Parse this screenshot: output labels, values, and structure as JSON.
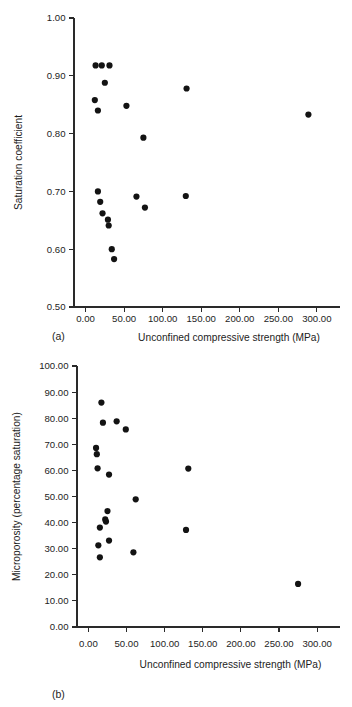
{
  "figure": {
    "panel_a_label": "(a)",
    "panel_b_label": "(b)"
  },
  "chart_data": [
    {
      "type": "scatter",
      "panel": "(a)",
      "title": "",
      "xlabel": "Unconfined compressive strength (MPa)",
      "ylabel": "Saturation coefficient",
      "xlim": [
        -15,
        330
      ],
      "ylim": [
        0.5,
        1.0
      ],
      "xticks": [
        0,
        50,
        100,
        150,
        200,
        250,
        300
      ],
      "xticklabels": [
        "0.00",
        "50.00",
        "100.00",
        "150.00",
        "200.00",
        "250.00",
        "300.00"
      ],
      "yticks": [
        0.5,
        0.6,
        0.7,
        0.8,
        0.9,
        1.0
      ],
      "yticklabels": [
        "0.50",
        "0.60",
        "0.70",
        "0.80",
        "0.90",
        "1.00"
      ],
      "grid": false,
      "legend": false,
      "marker": "circle",
      "marker_color": "#131313",
      "points": [
        {
          "x": 13,
          "y": 0.918
        },
        {
          "x": 21,
          "y": 0.918
        },
        {
          "x": 31,
          "y": 0.918
        },
        {
          "x": 25,
          "y": 0.888
        },
        {
          "x": 12,
          "y": 0.858
        },
        {
          "x": 16,
          "y": 0.84
        },
        {
          "x": 53,
          "y": 0.848
        },
        {
          "x": 131,
          "y": 0.878
        },
        {
          "x": 289,
          "y": 0.833
        },
        {
          "x": 75,
          "y": 0.793
        },
        {
          "x": 16,
          "y": 0.7
        },
        {
          "x": 19,
          "y": 0.682
        },
        {
          "x": 22,
          "y": 0.662
        },
        {
          "x": 29,
          "y": 0.651
        },
        {
          "x": 30,
          "y": 0.641
        },
        {
          "x": 34,
          "y": 0.6
        },
        {
          "x": 37,
          "y": 0.583
        },
        {
          "x": 66,
          "y": 0.691
        },
        {
          "x": 77,
          "y": 0.672
        },
        {
          "x": 130,
          "y": 0.692
        }
      ]
    },
    {
      "type": "scatter",
      "panel": "(b)",
      "title": "",
      "xlabel": "Unconfined compressive strength (MPa)",
      "ylabel": "Microporosity (percentage saturation)",
      "xlim": [
        -15,
        330
      ],
      "ylim": [
        0.0,
        100.0
      ],
      "xticks": [
        0,
        50,
        100,
        150,
        200,
        250,
        300
      ],
      "xticklabels": [
        "0.00",
        "50.00",
        "100.00",
        "150.00",
        "200.00",
        "250.00",
        "300.00"
      ],
      "yticks": [
        0,
        10,
        20,
        30,
        40,
        50,
        60,
        70,
        80,
        90,
        100
      ],
      "yticklabels": [
        "0.00",
        "10.00",
        "20.00",
        "30.00",
        "40.00",
        "50.00",
        "60.00",
        "70.00",
        "80.00",
        "90.00",
        "100.00"
      ],
      "grid": false,
      "legend": false,
      "marker": "circle",
      "marker_color": "#131313",
      "points": [
        {
          "x": 17,
          "y": 86.0
        },
        {
          "x": 19,
          "y": 78.3
        },
        {
          "x": 37,
          "y": 78.8
        },
        {
          "x": 49,
          "y": 75.7
        },
        {
          "x": 10,
          "y": 68.6
        },
        {
          "x": 11,
          "y": 66.2
        },
        {
          "x": 12,
          "y": 60.8
        },
        {
          "x": 27,
          "y": 58.4
        },
        {
          "x": 131,
          "y": 60.7
        },
        {
          "x": 62,
          "y": 48.9
        },
        {
          "x": 25,
          "y": 44.4
        },
        {
          "x": 22,
          "y": 41.2
        },
        {
          "x": 23,
          "y": 40.4
        },
        {
          "x": 15,
          "y": 38.1
        },
        {
          "x": 128,
          "y": 37.2
        },
        {
          "x": 13,
          "y": 31.3
        },
        {
          "x": 27,
          "y": 33.1
        },
        {
          "x": 59,
          "y": 28.6
        },
        {
          "x": 15,
          "y": 26.7
        },
        {
          "x": 275,
          "y": 16.5
        }
      ]
    }
  ]
}
